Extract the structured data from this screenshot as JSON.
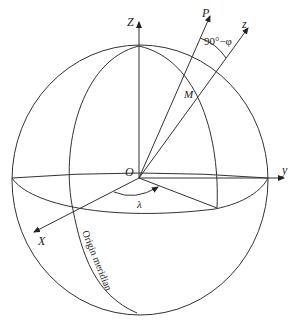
{
  "diagram": {
    "labels": {
      "z_axis": "Z",
      "p_axis": "P",
      "z_local": "z",
      "angle": "90°−φ",
      "point_m": "M",
      "origin": "O",
      "y_axis": "y",
      "x_axis": "X",
      "lambda": "λ",
      "meridian": "Origin meridian"
    },
    "colors": {
      "stroke": "#333333",
      "background": "#ffffff"
    }
  }
}
